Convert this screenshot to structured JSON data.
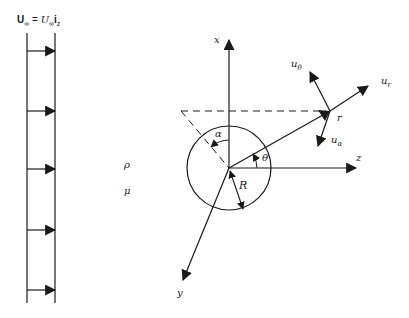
{
  "diagram": {
    "title": {
      "lhs_symbol": "U",
      "lhs_sub": "∞",
      "equals": "=",
      "rhs_symbol": "U",
      "rhs_sub": "∞",
      "rhs_unit": "i",
      "rhs_unit_sub": "z"
    },
    "uniform_flow": {
      "arrow_count": 5,
      "arrow_y": [
        51,
        111,
        169,
        230,
        290
      ]
    },
    "properties": {
      "density": "ρ",
      "viscosity": "μ"
    },
    "axes": {
      "x": "x",
      "y": "y",
      "z": "z"
    },
    "sphere": {
      "radius_label": "R"
    },
    "angles": {
      "alpha": "α",
      "theta": "θ"
    },
    "point": {
      "label": "r"
    },
    "velocity_components": {
      "u_r": "u",
      "u_r_sub": "r",
      "u_theta": "u",
      "u_theta_sub": "θ",
      "u_alpha": "u",
      "u_alpha_sub": "α"
    },
    "colors": {
      "ink": "#1a1a1a",
      "background": "#ffffff"
    }
  }
}
